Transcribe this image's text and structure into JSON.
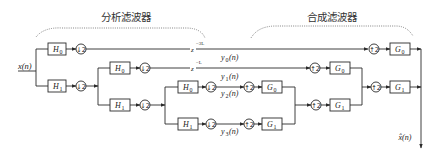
{
  "titles": {
    "analysis": "分析滤波器",
    "synthesis": "合成滤波器"
  },
  "signals": {
    "input": "x(n)",
    "output": "x̂(n)",
    "subbands": [
      {
        "name": "y",
        "sub": "0",
        "arg": "(n)"
      },
      {
        "name": "y",
        "sub": "1",
        "arg": "(n)"
      },
      {
        "name": "y",
        "sub": "2",
        "arg": "(n)"
      },
      {
        "name": "y",
        "sub": "3",
        "arg": "(n)"
      }
    ]
  },
  "blocks": {
    "analysis": [
      {
        "name": "H",
        "sub": "0"
      },
      {
        "name": "H",
        "sub": "1"
      },
      {
        "name": "H",
        "sub": "0"
      },
      {
        "name": "H",
        "sub": "1"
      },
      {
        "name": "H",
        "sub": "0"
      },
      {
        "name": "H",
        "sub": "1"
      }
    ],
    "synthesis": [
      {
        "name": "G",
        "sub": "0"
      },
      {
        "name": "G",
        "sub": "1"
      },
      {
        "name": "G",
        "sub": "0"
      },
      {
        "name": "G",
        "sub": "1"
      },
      {
        "name": "G",
        "sub": "0"
      },
      {
        "name": "G",
        "sub": "1"
      }
    ]
  },
  "operators": {
    "downsample": "↓2",
    "upsample": "↑2"
  },
  "delays": [
    {
      "base": "z",
      "exp": "−3L"
    },
    {
      "base": "z",
      "exp": "−L"
    }
  ],
  "colors": {
    "line": "#2a2a2a",
    "bracket": "#777777",
    "background": "#ffffff"
  }
}
